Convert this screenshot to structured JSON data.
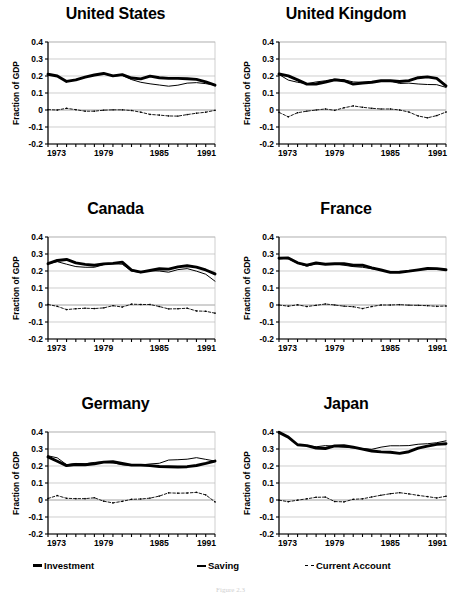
{
  "figure": {
    "caption": "Figure 2.3",
    "ylabel": "Fraction of GDP",
    "yticks": [
      "0.4",
      "0.3",
      "0.2",
      "0.1",
      "0",
      "-0.1",
      "-0.2"
    ],
    "xticks": [
      "1973",
      "1979",
      "1985",
      "1991"
    ],
    "colors": {
      "line": "#000000",
      "grid": "#b9b9b9",
      "axis": "#000000",
      "background": "#ffffff"
    }
  },
  "legend": {
    "items": [
      {
        "key": "investment",
        "label": "Investment",
        "style": "thick-solid"
      },
      {
        "key": "saving",
        "label": "Saving",
        "style": "thin-solid"
      },
      {
        "key": "current_account",
        "label": "Current Account",
        "style": "dashed"
      }
    ]
  },
  "chart_data": [
    {
      "type": "line",
      "title": "United States",
      "xlabel": "",
      "ylabel": "Fraction of GDP",
      "xlim": [
        1973,
        1991
      ],
      "ylim": [
        -0.2,
        0.4
      ],
      "grid": true,
      "legend_position": "bottom-shared",
      "x": [
        1973,
        1974,
        1975,
        1976,
        1977,
        1978,
        1979,
        1980,
        1981,
        1982,
        1983,
        1984,
        1985,
        1986,
        1987,
        1988,
        1989,
        1990,
        1991
      ],
      "series": [
        {
          "name": "Investment",
          "values": [
            0.21,
            0.2,
            0.168,
            0.177,
            0.193,
            0.206,
            0.215,
            0.201,
            0.208,
            0.188,
            0.183,
            0.199,
            0.19,
            0.186,
            0.186,
            0.184,
            0.18,
            0.166,
            0.146
          ]
        },
        {
          "name": "Saving",
          "values": [
            0.209,
            0.2,
            0.168,
            0.177,
            0.192,
            0.206,
            0.213,
            0.199,
            0.204,
            0.179,
            0.163,
            0.154,
            0.147,
            0.14,
            0.146,
            0.158,
            0.161,
            0.155,
            0.147
          ]
        },
        {
          "name": "Current Account",
          "values": [
            0.002,
            0.0,
            0.01,
            0.002,
            -0.007,
            -0.007,
            -0.001,
            0.001,
            0.001,
            -0.003,
            -0.013,
            -0.026,
            -0.03,
            -0.035,
            -0.036,
            -0.027,
            -0.019,
            -0.013,
            -0.002
          ]
        }
      ]
    },
    {
      "type": "line",
      "title": "United Kingdom",
      "xlabel": "",
      "ylabel": "Fraction of GDP",
      "xlim": [
        1973,
        1991
      ],
      "ylim": [
        -0.2,
        0.4
      ],
      "grid": true,
      "legend_position": "bottom-shared",
      "x": [
        1973,
        1974,
        1975,
        1976,
        1977,
        1978,
        1979,
        1980,
        1981,
        1982,
        1983,
        1984,
        1985,
        1986,
        1987,
        1988,
        1989,
        1990,
        1991
      ],
      "series": [
        {
          "name": "Investment",
          "values": [
            0.212,
            0.201,
            0.177,
            0.152,
            0.153,
            0.164,
            0.177,
            0.172,
            0.152,
            0.159,
            0.163,
            0.172,
            0.172,
            0.168,
            0.173,
            0.19,
            0.195,
            0.186,
            0.142
          ]
        },
        {
          "name": "Saving",
          "values": [
            0.209,
            0.176,
            0.163,
            0.155,
            0.165,
            0.172,
            0.182,
            0.178,
            0.165,
            0.163,
            0.164,
            0.17,
            0.171,
            0.156,
            0.158,
            0.153,
            0.15,
            0.149,
            0.133
          ]
        },
        {
          "name": "Current Account",
          "values": [
            -0.014,
            -0.04,
            -0.016,
            -0.007,
            0.0,
            0.006,
            -0.002,
            0.013,
            0.024,
            0.016,
            0.01,
            0.006,
            0.006,
            0.0,
            -0.012,
            -0.035,
            -0.046,
            -0.033,
            -0.012
          ]
        }
      ]
    },
    {
      "type": "line",
      "title": "Canada",
      "xlabel": "",
      "ylabel": "Fraction of GDP",
      "xlim": [
        1973,
        1991
      ],
      "ylim": [
        -0.2,
        0.4
      ],
      "grid": true,
      "legend_position": "bottom-shared",
      "x": [
        1973,
        1974,
        1975,
        1976,
        1977,
        1978,
        1979,
        1980,
        1981,
        1982,
        1983,
        1984,
        1985,
        1986,
        1987,
        1988,
        1989,
        1990,
        1991
      ],
      "series": [
        {
          "name": "Investment",
          "values": [
            0.243,
            0.262,
            0.268,
            0.248,
            0.239,
            0.234,
            0.242,
            0.245,
            0.252,
            0.205,
            0.193,
            0.203,
            0.213,
            0.211,
            0.224,
            0.231,
            0.223,
            0.206,
            0.183
          ]
        },
        {
          "name": "Saving",
          "values": [
            0.243,
            0.255,
            0.24,
            0.226,
            0.222,
            0.222,
            0.237,
            0.243,
            0.24,
            0.2,
            0.192,
            0.202,
            0.2,
            0.193,
            0.208,
            0.214,
            0.199,
            0.181,
            0.14
          ]
        },
        {
          "name": "Current Account",
          "values": [
            0.003,
            -0.008,
            -0.027,
            -0.022,
            -0.019,
            -0.021,
            -0.017,
            -0.004,
            -0.012,
            0.005,
            0.003,
            0.003,
            -0.009,
            -0.023,
            -0.022,
            -0.019,
            -0.035,
            -0.037,
            -0.048
          ]
        }
      ]
    },
    {
      "type": "line",
      "title": "France",
      "xlabel": "",
      "ylabel": "Fraction of GDP",
      "xlim": [
        1973,
        1991
      ],
      "ylim": [
        -0.2,
        0.4
      ],
      "grid": true,
      "legend_position": "bottom-shared",
      "x": [
        1973,
        1974,
        1975,
        1976,
        1977,
        1978,
        1979,
        1980,
        1981,
        1982,
        1983,
        1984,
        1985,
        1986,
        1987,
        1988,
        1989,
        1990,
        1991
      ],
      "series": [
        {
          "name": "Investment",
          "values": [
            0.275,
            0.277,
            0.248,
            0.235,
            0.247,
            0.24,
            0.243,
            0.243,
            0.234,
            0.234,
            0.218,
            0.206,
            0.192,
            0.193,
            0.199,
            0.207,
            0.215,
            0.214,
            0.207
          ]
        },
        {
          "name": "Saving",
          "values": [
            0.277,
            0.272,
            0.246,
            0.228,
            0.243,
            0.243,
            0.243,
            0.234,
            0.226,
            0.222,
            0.213,
            0.206,
            0.192,
            0.196,
            0.198,
            0.206,
            0.213,
            0.211,
            0.205
          ]
        },
        {
          "name": "Current Account",
          "values": [
            0.0,
            -0.007,
            0.001,
            -0.009,
            -0.002,
            0.006,
            0.0,
            -0.007,
            -0.01,
            -0.021,
            -0.009,
            0.0,
            0.0,
            0.002,
            -0.001,
            -0.002,
            -0.004,
            -0.008,
            -0.006
          ]
        }
      ]
    },
    {
      "type": "line",
      "title": "Germany",
      "xlabel": "",
      "ylabel": "Fraction of GDP",
      "xlim": [
        1973,
        1991
      ],
      "ylim": [
        -0.2,
        0.4
      ],
      "grid": true,
      "legend_position": "bottom-shared",
      "x": [
        1973,
        1974,
        1975,
        1976,
        1977,
        1978,
        1979,
        1980,
        1981,
        1982,
        1983,
        1984,
        1985,
        1986,
        1987,
        1988,
        1989,
        1990,
        1991
      ],
      "series": [
        {
          "name": "Investment",
          "values": [
            0.254,
            0.228,
            0.202,
            0.209,
            0.207,
            0.213,
            0.223,
            0.225,
            0.215,
            0.205,
            0.205,
            0.202,
            0.197,
            0.196,
            0.194,
            0.196,
            0.203,
            0.215,
            0.229
          ]
        },
        {
          "name": "Saving",
          "values": [
            0.26,
            0.248,
            0.208,
            0.215,
            0.213,
            0.221,
            0.224,
            0.219,
            0.207,
            0.203,
            0.206,
            0.212,
            0.216,
            0.235,
            0.237,
            0.24,
            0.249,
            0.239,
            0.229
          ]
        },
        {
          "name": "Current Account",
          "values": [
            0.009,
            0.026,
            0.01,
            0.008,
            0.008,
            0.013,
            -0.007,
            -0.017,
            -0.008,
            0.004,
            0.006,
            0.011,
            0.023,
            0.042,
            0.04,
            0.041,
            0.045,
            0.03,
            -0.011
          ]
        }
      ]
    },
    {
      "type": "line",
      "title": "Japan",
      "xlabel": "",
      "ylabel": "Fraction of GDP",
      "xlim": [
        1973,
        1991
      ],
      "ylim": [
        -0.2,
        0.4
      ],
      "grid": true,
      "legend_position": "bottom-shared",
      "x": [
        1973,
        1974,
        1975,
        1976,
        1977,
        1978,
        1979,
        1980,
        1981,
        1982,
        1983,
        1984,
        1985,
        1986,
        1987,
        1988,
        1989,
        1990,
        1991
      ],
      "series": [
        {
          "name": "Investment",
          "values": [
            0.398,
            0.37,
            0.325,
            0.32,
            0.306,
            0.303,
            0.318,
            0.319,
            0.311,
            0.299,
            0.288,
            0.283,
            0.281,
            0.274,
            0.284,
            0.305,
            0.317,
            0.327,
            0.331
          ]
        },
        {
          "name": "Saving",
          "values": [
            0.398,
            0.369,
            0.323,
            0.32,
            0.313,
            0.32,
            0.317,
            0.311,
            0.306,
            0.303,
            0.298,
            0.311,
            0.319,
            0.319,
            0.32,
            0.328,
            0.331,
            0.337,
            0.348
          ]
        },
        {
          "name": "Current Account",
          "values": [
            -0.001,
            -0.01,
            -0.001,
            0.007,
            0.016,
            0.017,
            -0.009,
            -0.011,
            0.004,
            0.007,
            0.018,
            0.028,
            0.037,
            0.043,
            0.036,
            0.027,
            0.02,
            0.012,
            0.022
          ]
        }
      ]
    }
  ]
}
